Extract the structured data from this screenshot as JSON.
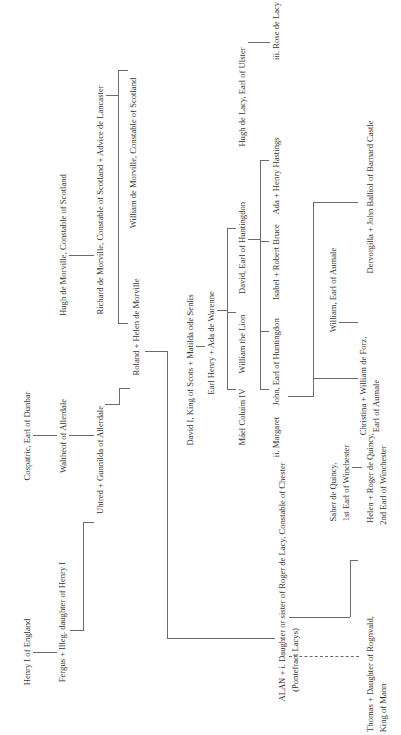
{
  "diagram": {
    "type": "family-tree",
    "orientation": "rotated-90-ccw",
    "nodes": {
      "henry_i": "Henry I of England",
      "fergus": "Fergus + Illeg. daughter of Henry I",
      "cospatric": "Cospatric, Earl of Dunbar",
      "waltheof": "Waltheof of Allerdale",
      "uhtred": "Uhtred + Gunnilda of Allerdale",
      "hugh_morville": "Hugh de Morville, Constable of Scotland",
      "richard_morville": "Richard de Morville, Constable of Scotland + Advice de Lancaster",
      "roland": "Roland + Helen de Morville",
      "william_morville": "William de Morville, Constable of Scotland",
      "david_i": "David I, King of Scots + Matilda ode Senlis",
      "earl_henry": "Earl Henry + Ada de Warenne",
      "mael_coluim": "Máel Coluim IV",
      "william_lion": "William the Lion",
      "david_huntingdon": "David, Earl of Huntingdon",
      "hugh_lacy": "Hugh de Lacy, Earl of Ulster",
      "margaret": "ii. Margaret",
      "john_huntingdon": "John, Earl of Huntingdon",
      "isabel": "Isabel + Robert Bruce",
      "ada": "Ada + Henry Hastings",
      "rose_lacy": "iii. Rose de Lacy",
      "william_aumale": "William, Earl of Aumale",
      "christina_l1": "Christina + William de Forz,",
      "christina_l2": "Earl of Aumale",
      "dervorgilla": "Dervorgilla + John Balliol of Barnard Castle",
      "alan": "ALAN + i. Daughter or sister of Roger de Lacy, Constable of Chester",
      "pontefract": "(Pontefract Lacys)",
      "saher_l1": "Saher de Quincy,",
      "saher_l2": "1st Earl of Winchester",
      "helen_l1": "Helen + Roger de Quincy,",
      "helen_l2": "2nd Earl of Winchester",
      "thomas_l1": "Thomas + Daughter of Rognvald,",
      "thomas_l2": "King of Mann"
    },
    "edges": [
      [
        "Henry I of England",
        "Fergus + Illeg. daughter of Henry I"
      ],
      [
        "Cospatric, Earl of Dunbar",
        "Waltheof of Allerdale"
      ],
      [
        "Waltheof of Allerdale",
        "Uhtred + Gunnilda of Allerdale"
      ],
      [
        "Fergus + Illeg. daughter of Henry I",
        "Uhtred + Gunnilda of Allerdale"
      ],
      [
        "Hugh de Morville, Constable of Scotland",
        "Richard de Morville, Constable of Scotland + Advice de Lancaster"
      ],
      [
        "Richard de Morville, Constable of Scotland + Advice de Lancaster",
        "Roland + Helen de Morville"
      ],
      [
        "Richard de Morville, Constable of Scotland + Advice de Lancaster",
        "William de Morville, Constable of Scotland"
      ],
      [
        "Uhtred + Gunnilda of Allerdale",
        "Roland + Helen de Morville"
      ],
      [
        "Roland + Helen de Morville",
        "ALAN"
      ],
      [
        "David I, King of Scots + Matilda ode Senlis",
        "Earl Henry + Ada de Warenne"
      ],
      [
        "Earl Henry + Ada de Warenne",
        "Máel Coluim IV"
      ],
      [
        "Earl Henry + Ada de Warenne",
        "William the Lion"
      ],
      [
        "Earl Henry + Ada de Warenne",
        "David, Earl of Huntingdon"
      ],
      [
        "David, Earl of Huntingdon",
        "ii. Margaret"
      ],
      [
        "David, Earl of Huntingdon",
        "John, Earl of Huntingdon"
      ],
      [
        "David, Earl of Huntingdon",
        "Isabel + Robert Bruce"
      ],
      [
        "David, Earl of Huntingdon",
        "Ada + Henry Hastings"
      ],
      [
        "Hugh de Lacy, Earl of Ulster",
        "iii. Rose de Lacy"
      ],
      [
        "ii. Margaret",
        "Christina + William de Forz, Earl of Aumale"
      ],
      [
        "ii. Margaret",
        "Dervorgilla + John Balliol of Barnard Castle"
      ],
      [
        "William, Earl of Aumale",
        "Christina + William de Forz, Earl of Aumale"
      ],
      [
        "Saher de Quincy, 1st Earl of Winchester",
        "Helen + Roger de Quincy, 2nd Earl of Winchester"
      ],
      [
        "ALAN",
        "Helen + Roger de Quincy, 2nd Earl of Winchester"
      ],
      [
        "ALAN",
        "Thomas + Daughter of Rognvald, King of Mann (illegitimate, dashed)"
      ]
    ]
  }
}
